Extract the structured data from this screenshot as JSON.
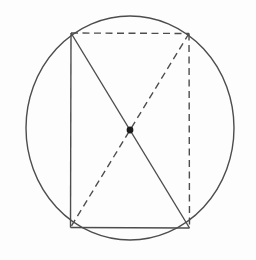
{
  "figure": {
    "canvas": {
      "width": 256,
      "height": 260
    },
    "background_color": "#fdfdfd",
    "stroke_color": "#4d4d4d",
    "dot_color": "#1c1c1c",
    "stroke_width": 1.4,
    "dash_pattern": "7 4.5",
    "circle": {
      "cx": 130,
      "cy": 128,
      "rx": 104,
      "ry": 112
    },
    "points": {
      "top_left": [
        71,
        33
      ],
      "top_right": [
        189,
        33.5
      ],
      "bottom_right": [
        189.5,
        228
      ],
      "bottom_left": [
        70.5,
        227.5
      ]
    },
    "center_point": {
      "cx": 130,
      "cy": 130,
      "r": 3.4
    },
    "lines": [
      {
        "name": "rect-left-side",
        "from": "top_left",
        "to": "bottom_left",
        "style": "solid"
      },
      {
        "name": "rect-bottom-side",
        "from": "bottom_left",
        "to": "bottom_right",
        "style": "solid"
      },
      {
        "name": "diagonal-tl-br",
        "from": "top_left",
        "to": "bottom_right",
        "style": "solid"
      },
      {
        "name": "rect-top-side",
        "from": "top_left",
        "to": "top_right",
        "style": "dashed"
      },
      {
        "name": "rect-right-side",
        "from": "top_right",
        "to": "bottom_right",
        "style": "dashed"
      },
      {
        "name": "diagonal-tr-bl",
        "from": "top_right",
        "to": "bottom_left",
        "style": "dashed"
      }
    ]
  }
}
